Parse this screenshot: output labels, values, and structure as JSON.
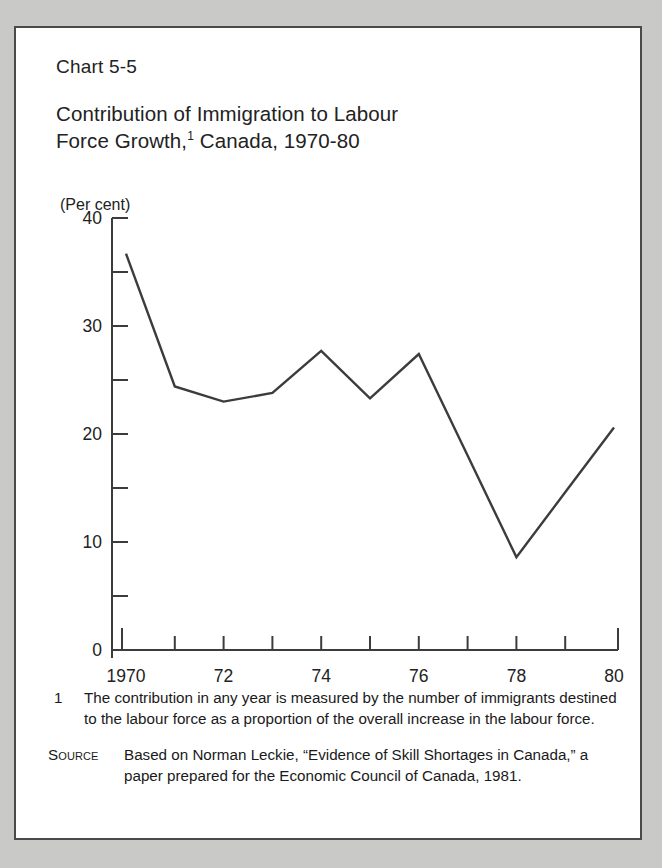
{
  "card": {
    "chart_number": "Chart 5-5",
    "title_line1": "Contribution of Immigration to Labour",
    "title_line2_prefix": "Force Growth,",
    "title_footnote_marker": "1",
    "title_line2_suffix": " Canada, 1970-80",
    "axis_unit": "(Per cent)"
  },
  "footnotes": {
    "note1_marker": "1",
    "note1_text": "The contribution in any year is measured by the number of immigrants destined to the labour force as a proportion of the overall increase in the labour force.",
    "source_marker": "Source",
    "source_text": "Based on Norman Leckie, “Evidence of Skill Shortages in Canada,” a paper prepared for the Economic Council of Canada, 1981."
  },
  "chart_data": {
    "type": "line",
    "xlabel": "",
    "ylabel": "(Per cent)",
    "ylim": [
      0,
      40
    ],
    "xlim": [
      1970,
      1980
    ],
    "grid": false,
    "legend": null,
    "y_major_ticks": [
      0,
      10,
      20,
      30,
      40
    ],
    "y_major_tick_labels": [
      "0",
      "10",
      "20",
      "30",
      "40"
    ],
    "y_minor_ticks": [
      5,
      15,
      25,
      35
    ],
    "x_ticks": [
      1970,
      1971,
      1972,
      1973,
      1974,
      1975,
      1976,
      1977,
      1978,
      1979,
      1980
    ],
    "x_tick_labels": [
      "1970",
      "",
      "72",
      "",
      "74",
      "",
      "76",
      "",
      "78",
      "",
      "80"
    ],
    "series": [
      {
        "name": "Contribution of immigration to labour force growth",
        "color": "#3c3c3c",
        "x": [
          1970,
          1971,
          1972,
          1973,
          1974,
          1975,
          1976,
          1977,
          1978,
          1979,
          1980
        ],
        "values": [
          36.7,
          24.4,
          23.0,
          23.8,
          27.7,
          23.3,
          27.4,
          18.0,
          8.6,
          14.6,
          20.6
        ]
      }
    ]
  }
}
